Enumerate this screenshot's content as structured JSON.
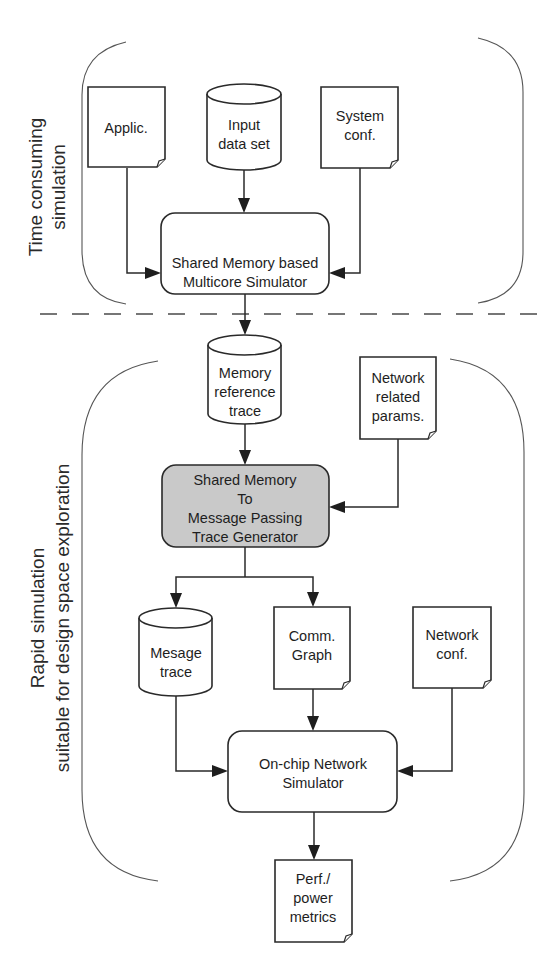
{
  "diagram": {
    "sections": {
      "top": {
        "label_lines": [
          "Time consuming",
          "simulation"
        ]
      },
      "bottom": {
        "label_lines": [
          "Rapid simulation",
          "suitable for design space exploration"
        ]
      }
    },
    "nodes": {
      "applic": {
        "type": "document",
        "lines": [
          "Applic."
        ]
      },
      "input_data": {
        "type": "database",
        "lines": [
          "Input",
          "data set"
        ]
      },
      "system_conf": {
        "type": "document",
        "lines": [
          "System",
          "conf."
        ]
      },
      "multicore_sim": {
        "type": "process",
        "lines": [
          "Shared Memory based",
          "Multicore Simulator"
        ]
      },
      "mem_ref_trace": {
        "type": "database",
        "lines": [
          "Memory",
          "reference",
          "trace"
        ]
      },
      "net_params": {
        "type": "document",
        "lines": [
          "Network",
          "related",
          "params."
        ]
      },
      "trace_gen": {
        "type": "process-highlighted",
        "lines": [
          "Shared Memory",
          "To",
          "Message Passing",
          "Trace Generator"
        ]
      },
      "msg_trace": {
        "type": "database",
        "lines": [
          "Mesage",
          "trace"
        ]
      },
      "comm_graph": {
        "type": "document",
        "lines": [
          "Comm.",
          "Graph"
        ]
      },
      "net_conf": {
        "type": "document",
        "lines": [
          "Network",
          "conf."
        ]
      },
      "noc_sim": {
        "type": "process",
        "lines": [
          "On-chip Network",
          "Simulator"
        ]
      },
      "perf_metrics": {
        "type": "document",
        "lines": [
          "Perf./",
          "power",
          "metrics"
        ]
      }
    },
    "edges": [
      {
        "from": "applic",
        "to": "multicore_sim"
      },
      {
        "from": "input_data",
        "to": "multicore_sim"
      },
      {
        "from": "system_conf",
        "to": "multicore_sim"
      },
      {
        "from": "multicore_sim",
        "to": "mem_ref_trace"
      },
      {
        "from": "mem_ref_trace",
        "to": "trace_gen"
      },
      {
        "from": "net_params",
        "to": "trace_gen"
      },
      {
        "from": "trace_gen",
        "to": "msg_trace"
      },
      {
        "from": "trace_gen",
        "to": "comm_graph"
      },
      {
        "from": "msg_trace",
        "to": "noc_sim"
      },
      {
        "from": "comm_graph",
        "to": "noc_sim"
      },
      {
        "from": "net_conf",
        "to": "noc_sim"
      },
      {
        "from": "noc_sim",
        "to": "perf_metrics"
      }
    ],
    "colors": {
      "highlight_fill": "#c9c9c9",
      "stroke": "#2a2a2a"
    }
  }
}
